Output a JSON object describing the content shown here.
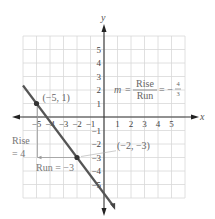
{
  "chart_data": {
    "type": "line",
    "title": "",
    "xlabel": "x",
    "ylabel": "y",
    "xlim": [
      -6,
      6
    ],
    "ylim": [
      -6,
      6
    ],
    "grid": true,
    "x_ticks": [
      "-5",
      "-4",
      "-3",
      "-2",
      "-1",
      "1",
      "2",
      "3",
      "4",
      "5"
    ],
    "y_ticks": [
      "5",
      "4",
      "3",
      "2",
      "1",
      "-1",
      "-2",
      "-3",
      "-4",
      "-5"
    ],
    "series": [
      {
        "name": "line",
        "slope": "-4/3",
        "x": [
          -6,
          0.75
        ],
        "y": [
          2.333,
          -6.667
        ]
      }
    ],
    "points": [
      {
        "x": -5,
        "y": 1,
        "label": "(−5, 1)"
      },
      {
        "x": -2,
        "y": -3,
        "label": "(−2, −3)"
      }
    ],
    "annotations": {
      "slope_prefix": "m =",
      "slope_num": "Rise",
      "slope_den": "Run",
      "slope_eq": "= −",
      "slope_value_num": "4",
      "slope_value_den": "3",
      "rise_label_1": "Rise",
      "rise_label_2": "= 4",
      "run_label": "Run = −3"
    }
  }
}
